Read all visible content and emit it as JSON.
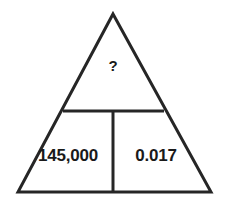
{
  "figure": {
    "name": "formula-triangle",
    "shape": "triangle",
    "background_color": "#ffffff",
    "stroke_color": "#262626",
    "text_color": "#1a1a1a",
    "stroke_width": 3,
    "geometry": {
      "apex": [
        113,
        14
      ],
      "bottom_left": [
        18,
        192
      ],
      "bottom_right": [
        211,
        192
      ],
      "horizontal_divider_y": 111,
      "horizontal_divider_x_start": 63,
      "horizontal_divider_x_end": 164,
      "vertical_divider_x": 113,
      "vertical_divider_y_start": 111,
      "vertical_divider_y_end": 192
    },
    "cells": {
      "top": {
        "label": "?",
        "role": "unknown-value"
      },
      "bottom_left": {
        "label": "145,000",
        "role": "known-value"
      },
      "bottom_right": {
        "label": "0.017",
        "role": "known-value"
      }
    }
  }
}
